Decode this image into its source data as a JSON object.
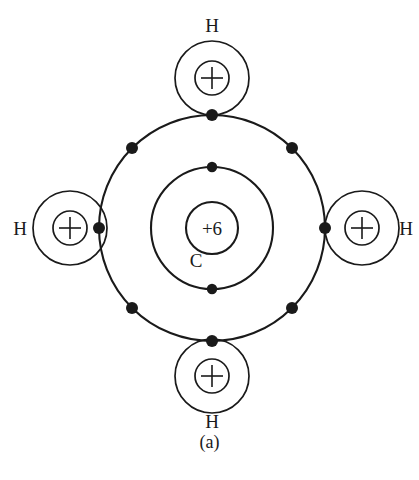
{
  "figure": {
    "caption": "(a)",
    "molecule": "CH4"
  },
  "central_atom": {
    "symbol": "C",
    "nucleus_label": "+6",
    "nucleus_charge": 6,
    "center": {
      "x": 212,
      "y": 228
    },
    "nucleus_radius": 26,
    "shells": [
      {
        "name": "inner-shell",
        "radius": 61,
        "electrons": 2
      },
      {
        "name": "outer-shell",
        "radius": 113,
        "electrons": 8
      }
    ],
    "inner_shell_electrons": [
      {
        "x": 212,
        "y": 167
      },
      {
        "x": 212,
        "y": 289
      }
    ],
    "outer_shell_electrons": [
      {
        "x": 212,
        "y": 115,
        "position": "top"
      },
      {
        "x": 292,
        "y": 148,
        "position": "upper-right"
      },
      {
        "x": 325,
        "y": 228,
        "position": "right"
      },
      {
        "x": 292,
        "y": 308,
        "position": "lower-right"
      },
      {
        "x": 212,
        "y": 341,
        "position": "bottom"
      },
      {
        "x": 132,
        "y": 308,
        "position": "lower-left"
      },
      {
        "x": 99,
        "y": 228,
        "position": "left"
      },
      {
        "x": 132,
        "y": 148,
        "position": "upper-left"
      }
    ]
  },
  "hydrogen_atoms": [
    {
      "symbol": "H",
      "nucleus_label": "+",
      "position": "top",
      "center": {
        "x": 212,
        "y": 78
      },
      "shell_radius": 37,
      "nucleus_radius": 17,
      "label_x": 212,
      "label_y": 32
    },
    {
      "symbol": "H",
      "nucleus_label": "+",
      "position": "right",
      "center": {
        "x": 362,
        "y": 228
      },
      "shell_radius": 37,
      "nucleus_radius": 17,
      "label_x": 406,
      "label_y": 235
    },
    {
      "symbol": "H",
      "nucleus_label": "+",
      "position": "bottom",
      "center": {
        "x": 212,
        "y": 376
      },
      "shell_radius": 37,
      "nucleus_radius": 17,
      "label_x": 212,
      "label_y": 428
    },
    {
      "symbol": "H",
      "nucleus_label": "+",
      "position": "left",
      "center": {
        "x": 70,
        "y": 228
      },
      "shell_radius": 37,
      "nucleus_radius": 17,
      "label_x": 20,
      "label_y": 235
    }
  ],
  "colors": {
    "ink": "#1a1a1a",
    "background": "#ffffff"
  }
}
